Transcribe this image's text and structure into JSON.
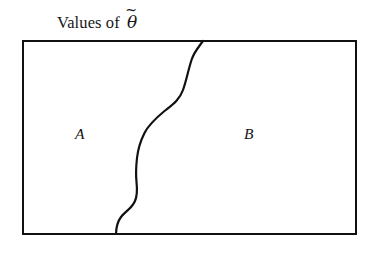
{
  "figure": {
    "caption": {
      "prefix": "Values of",
      "symbol_base": "θ",
      "symbol_accent": "~",
      "symbol_name": "theta-tilde",
      "full_text": "Values of θ̃"
    },
    "regions": [
      {
        "id": "a",
        "label": "A"
      },
      {
        "id": "b",
        "label": "B"
      }
    ],
    "box": {
      "name": "parameter-space-rectangle",
      "x": 23,
      "y": 41,
      "width": 333,
      "height": 193,
      "stroke": "#111111",
      "stroke_width": 2.6,
      "fill": "#ffffff"
    },
    "divider": {
      "name": "decision-boundary-curve",
      "stroke": "#111111",
      "stroke_width": 2.2,
      "start": [
        203,
        41
      ],
      "end": [
        116,
        234
      ],
      "path": "M 203 41 C 198 48 194 52 191.5 60 C 188 71 186.5 80 183 90 C 179.5 100 172 105 164.5 111 C 156 118 149 124 144.5 133 C 140.5 141 138 149 137 158 C 136 167 135.8 175 136.5 182 C 137.4 190 137.5 195 135 201 C 131.5 209 125.5 211 121 217 C 117.5 221.6 116.2 227 116 234"
    },
    "colors": {
      "ink": "#111111",
      "background": "#ffffff"
    }
  }
}
